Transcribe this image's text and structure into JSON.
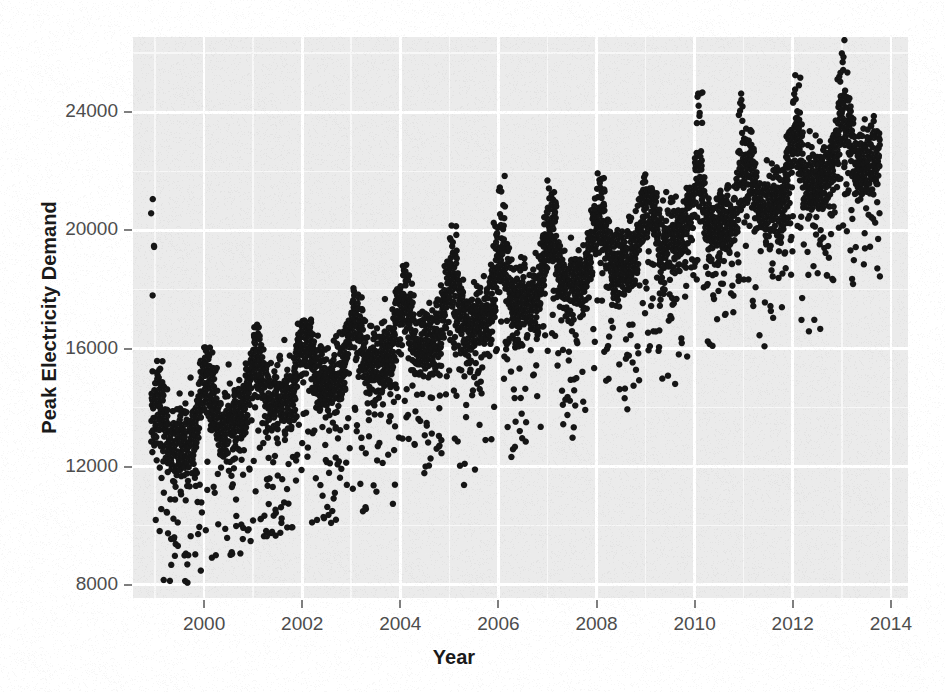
{
  "chart_data": {
    "type": "scatter",
    "title": "",
    "subtitle": "",
    "xlabel": "Year",
    "ylabel": "Peak Electricity Demand",
    "grid": true,
    "legend": null,
    "legend_position": "none",
    "xlim": [
      1998.55,
      2014.35
    ],
    "ylim": [
      7550,
      26550
    ],
    "x_ticks": [
      2000,
      2002,
      2004,
      2006,
      2008,
      2010,
      2012,
      2014
    ],
    "x_tick_labels": [
      "2000",
      "2002",
      "2004",
      "2006",
      "2008",
      "2010",
      "2012",
      "2014"
    ],
    "x_minor_ticks": [
      1999,
      2001,
      2003,
      2005,
      2007,
      2009,
      2011,
      2013
    ],
    "y_ticks": [
      8000,
      12000,
      16000,
      20000,
      24000
    ],
    "y_tick_labels": [
      "8000",
      "12000",
      "16000",
      "20000",
      "24000"
    ],
    "y_minor_ticks": [
      10000,
      14000,
      18000,
      22000,
      26000
    ],
    "point_count": 5400,
    "point_color": "#151515",
    "point_size_px": 6.4,
    "point_shape": "circle",
    "data_x_range": [
      1998.92,
      2013.78
    ],
    "data_description": "Daily peak electricity demand (MW) plotted against year, 1999 through late 2013. Shows a strong upward trend, repeating annual summer peaks, and a downward scatter of low-demand outlier days.",
    "series": [
      {
        "name": "Peak Electricity Demand",
        "color": "#151515",
        "trend": {
          "type": "linear",
          "baseline_at_1999": 12450,
          "baseline_at_2013": 21900,
          "noise_sd": 620
        },
        "annual_cycle": {
          "summer_peak_amplitude": 2100,
          "summer_peak_phase_fraction": 0.05,
          "winter_secondary_amplitude": 750,
          "spike_fraction": 0.08,
          "spike_extra": 2600
        },
        "low_outliers": {
          "fraction": 0.11,
          "depth_min": 1400,
          "depth_max": 5200
        },
        "yearly_peak_maxima": [
          {
            "year": 1999,
            "value": 15200
          },
          {
            "year": 2000,
            "value": 15650
          },
          {
            "year": 2001,
            "value": 16400
          },
          {
            "year": 2002,
            "value": 16550
          },
          {
            "year": 2003,
            "value": 17600
          },
          {
            "year": 2004,
            "value": 18500
          },
          {
            "year": 2005,
            "value": 19900
          },
          {
            "year": 2006,
            "value": 21500
          },
          {
            "year": 2007,
            "value": 21100
          },
          {
            "year": 2008,
            "value": 21600
          },
          {
            "year": 2009,
            "value": 21000
          },
          {
            "year": 2010,
            "value": 24300
          },
          {
            "year": 2011,
            "value": 23000
          },
          {
            "year": 2012,
            "value": 25100
          },
          {
            "year": 2013,
            "value": 26200
          }
        ],
        "yearly_baseline_minima": [
          {
            "year": 1999,
            "value": 8250
          },
          {
            "year": 2000,
            "value": 9100
          },
          {
            "year": 2001,
            "value": 9900
          },
          {
            "year": 2002,
            "value": 10400
          },
          {
            "year": 2003,
            "value": 10800
          },
          {
            "year": 2004,
            "value": 11000
          },
          {
            "year": 2005,
            "value": 11600
          },
          {
            "year": 2006,
            "value": 12200
          },
          {
            "year": 2007,
            "value": 12700
          },
          {
            "year": 2008,
            "value": 13000
          },
          {
            "year": 2009,
            "value": 12500
          },
          {
            "year": 2010,
            "value": 13800
          },
          {
            "year": 2011,
            "value": 14400
          },
          {
            "year": 2012,
            "value": 15100
          },
          {
            "year": 2013,
            "value": 15600
          }
        ]
      }
    ]
  },
  "theme": {
    "panel_background": "#ebebeb",
    "major_gridline_color": "#ffffff",
    "minor_gridline_color": "#f7f7f7",
    "tick_label_color": "#4d4d4d",
    "axis_title_color": "#1a1a1a",
    "tick_mark_color": "#7f7f7f",
    "figure_background": "#ffffff"
  },
  "layout": {
    "panel_left": 133,
    "panel_top": 37,
    "panel_right": 908,
    "panel_bottom": 598
  },
  "scan_bleed_text": [
    "Computer-Use of a model that predicts wher",
    "in the data",
    "The  models  are  derived  from  the",
    "Electricity data set as can be pl",
    "data between 1999 and 2013 was cons",
    "variables in the series were compu",
    "the series were made on the mean",
    "predictions for the peak demand",
    "were calculated using the mea",
    "the temperature and the seasona",
    "The values shown in the figure",
    "summer of 2013 show a very c",
    "in peak demand associated wit",
    "temperature above the thresho"
  ]
}
